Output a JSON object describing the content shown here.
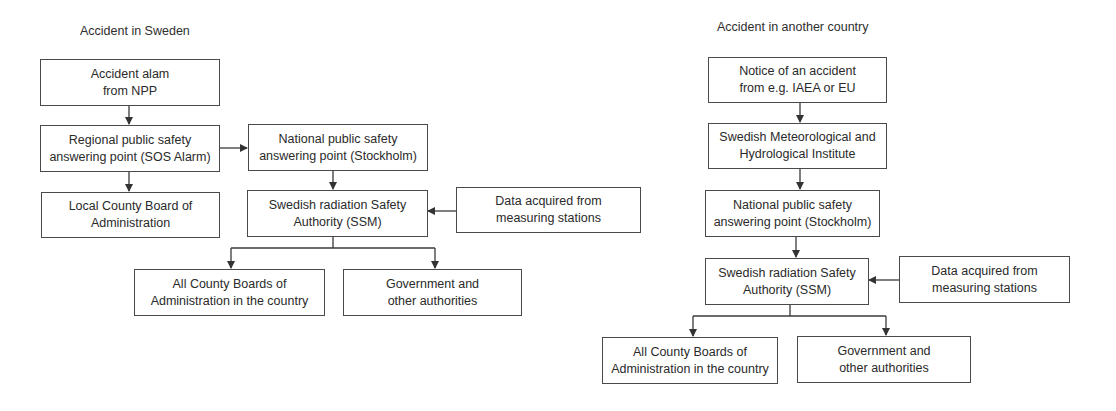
{
  "left_diagram": {
    "title": "Accident in Sweden",
    "nodes": {
      "alarm": [
        "Accident alam",
        "from NPP"
      ],
      "regional": [
        "Regional public safety",
        "answering point (SOS Alarm)"
      ],
      "national": [
        "National public safety",
        "answering point (Stockholm)"
      ],
      "local_county": [
        "Local County Board of",
        "Administration"
      ],
      "ssm": [
        "Swedish radiation Safety",
        "Authority (SSM)"
      ],
      "data": [
        "Data acquired from",
        "measuring stations"
      ],
      "all_county": [
        "All County Boards of",
        "Administration in the country"
      ],
      "government": [
        "Government and",
        "other authorities"
      ]
    },
    "edges": [
      [
        "alarm",
        "regional"
      ],
      [
        "regional",
        "national"
      ],
      [
        "regional",
        "local_county"
      ],
      [
        "national",
        "ssm"
      ],
      [
        "data",
        "ssm"
      ],
      [
        "ssm",
        "all_county"
      ],
      [
        "ssm",
        "government"
      ]
    ]
  },
  "right_diagram": {
    "title": "Accident in another country",
    "nodes": {
      "notice": [
        "Notice of an accident",
        "from e.g. IAEA or EU"
      ],
      "smhi": [
        "Swedish Meteorological and",
        "Hydrological Institute"
      ],
      "national": [
        "National public safety",
        "answering point (Stockholm)"
      ],
      "ssm": [
        "Swedish radiation Safety",
        "Authority (SSM)"
      ],
      "data": [
        "Data acquired from",
        "measuring stations"
      ],
      "all_county": [
        "All County Boards of",
        "Administration in the country"
      ],
      "government": [
        "Government and",
        "other authorities"
      ]
    },
    "edges": [
      [
        "notice",
        "smhi"
      ],
      [
        "smhi",
        "national"
      ],
      [
        "national",
        "ssm"
      ],
      [
        "data",
        "ssm"
      ],
      [
        "ssm",
        "all_county"
      ],
      [
        "ssm",
        "government"
      ]
    ]
  },
  "colors": {
    "line": "#3a3a3a",
    "border": "#4a4a4a",
    "text": "#2a2a2a"
  }
}
